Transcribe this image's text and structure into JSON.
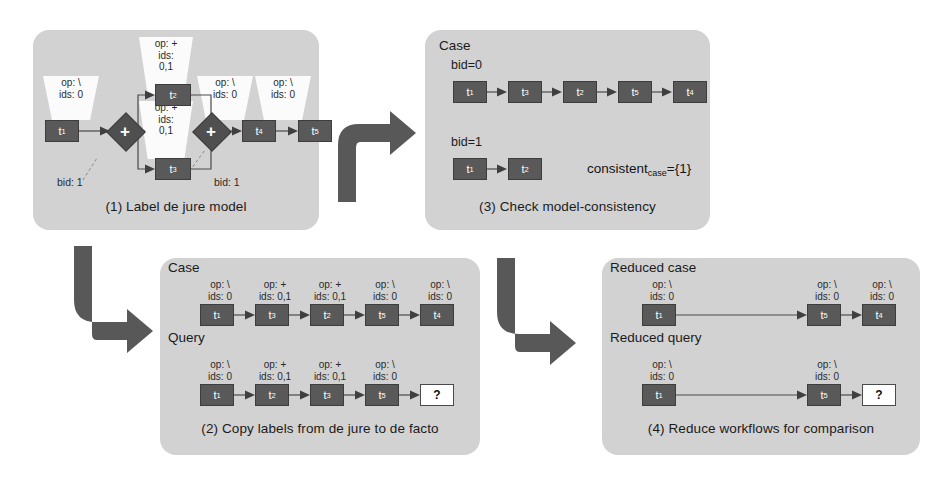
{
  "figure": {
    "type": "process-diagram"
  },
  "colors": {
    "panel_background": "#d2d2d2",
    "node_fill": "#595959",
    "node_text": "#ffffff",
    "open_node_fill": "#ffffff",
    "connector_arrow": "#585858",
    "edge": "#4a4a4a",
    "balloon_fill": "#fbfbfb"
  },
  "panels": {
    "p1": {
      "caption": "(1) Label de jure model",
      "nodes": [
        {
          "id": "t1",
          "base": "t",
          "sub": "1"
        },
        {
          "id": "t2",
          "base": "t",
          "sub": "2"
        },
        {
          "id": "t3",
          "base": "t",
          "sub": "3"
        },
        {
          "id": "t4",
          "base": "t",
          "sub": "4"
        },
        {
          "id": "t5",
          "base": "t",
          "sub": "5"
        }
      ],
      "gateways": [
        {
          "id": "gw-split",
          "symbol": "+",
          "kind": "and-split"
        },
        {
          "id": "gw-join",
          "symbol": "+",
          "kind": "and-join"
        }
      ],
      "balloons": [
        {
          "for": "t1",
          "op": "op: \\",
          "ids": "ids: 0"
        },
        {
          "for": "t2",
          "op": "op: +",
          "ids": "ids:",
          "ids2": "0,1"
        },
        {
          "for": "t3",
          "op": "op: +",
          "ids": "ids:",
          "ids2": "0,1"
        },
        {
          "for": "t4",
          "op": "op: \\",
          "ids": "ids: 0"
        },
        {
          "for": "t5",
          "op": "op: \\",
          "ids": "ids: 0"
        }
      ],
      "bid_labels": [
        {
          "text": "bid: 1",
          "for": "gw-split"
        },
        {
          "text": "bid: 1",
          "for": "gw-join"
        }
      ]
    },
    "p3": {
      "caption": "(3) Check model-consistency",
      "heading": "Case",
      "traces": [
        {
          "label": "bid=0",
          "sequence": [
            {
              "base": "t",
              "sub": "1"
            },
            {
              "base": "t",
              "sub": "3"
            },
            {
              "base": "t",
              "sub": "2"
            },
            {
              "base": "t",
              "sub": "5"
            },
            {
              "base": "t",
              "sub": "4"
            }
          ]
        },
        {
          "label": "bid=1",
          "sequence": [
            {
              "base": "t",
              "sub": "1"
            },
            {
              "base": "t",
              "sub": "2"
            }
          ]
        }
      ],
      "consistent": {
        "name": "consistent",
        "sub": "case",
        "value": "={1}"
      }
    },
    "p2": {
      "caption": "(2) Copy labels from de jure to de facto",
      "rows": [
        {
          "heading": "Case",
          "sequence": [
            {
              "base": "t",
              "sub": "1",
              "op": "op: \\",
              "ids": "ids: 0"
            },
            {
              "base": "t",
              "sub": "3",
              "op": "op: +",
              "ids": "ids: 0,1"
            },
            {
              "base": "t",
              "sub": "2",
              "op": "op: +",
              "ids": "ids: 0,1"
            },
            {
              "base": "t",
              "sub": "5",
              "op": "op: \\",
              "ids": "ids: 0"
            },
            {
              "base": "t",
              "sub": "4",
              "op": "op: \\",
              "ids": "ids: 0"
            }
          ]
        },
        {
          "heading": "Query",
          "sequence": [
            {
              "base": "t",
              "sub": "1",
              "op": "op: \\",
              "ids": "ids: 0"
            },
            {
              "base": "t",
              "sub": "2",
              "op": "op: +",
              "ids": "ids: 0,1"
            },
            {
              "base": "t",
              "sub": "3",
              "op": "op: +",
              "ids": "ids: 0,1"
            },
            {
              "base": "t",
              "sub": "5",
              "op": "op: \\",
              "ids": "ids: 0"
            },
            {
              "base": "?",
              "sub": "",
              "op": "",
              "ids": "",
              "open": true
            }
          ]
        }
      ]
    },
    "p4": {
      "caption": "(4) Reduce workflows for comparison",
      "rows": [
        {
          "heading": "Reduced case",
          "sequence": [
            {
              "base": "t",
              "sub": "1",
              "op": "op: \\",
              "ids": "ids: 0"
            },
            {
              "base": "t",
              "sub": "5",
              "op": "op: \\",
              "ids": "ids: 0"
            },
            {
              "base": "t",
              "sub": "4",
              "op": "op: \\",
              "ids": "ids: 0"
            }
          ]
        },
        {
          "heading": "Reduced query",
          "sequence": [
            {
              "base": "t",
              "sub": "1",
              "op": "op: \\",
              "ids": "ids: 0"
            },
            {
              "base": "t",
              "sub": "5",
              "op": "op: \\",
              "ids": "ids: 0"
            },
            {
              "base": "?",
              "sub": "",
              "op": "",
              "ids": "",
              "open": true
            }
          ]
        }
      ]
    }
  },
  "connectors": [
    {
      "id": "c1",
      "from": "p1",
      "to": "p3",
      "shape": "up-right"
    },
    {
      "id": "c2",
      "from": "p1",
      "to": "p2",
      "shape": "down-right"
    },
    {
      "id": "c3",
      "from": "p2",
      "to": "p4",
      "shape": "down-right"
    }
  ]
}
